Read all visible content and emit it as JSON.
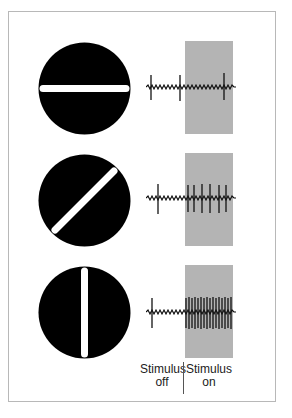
{
  "figure": {
    "title": "",
    "rows": [
      {
        "stimulus": "horizontal-bar",
        "orientation_deg": 0,
        "response": "weak"
      },
      {
        "stimulus": "diagonal-bar",
        "orientation_deg": 45,
        "response": "moderate"
      },
      {
        "stimulus": "vertical-bar",
        "orientation_deg": 90,
        "response": "strong"
      }
    ],
    "labels": {
      "off_line1": "Stimulus",
      "off_line2": "off",
      "on_line1": "Stimulus",
      "on_line2": "on"
    },
    "colors": {
      "stimulus_disk": "#000000",
      "bar": "#ffffff",
      "stimulus_on_region": "#b4b4b4",
      "frame": "#b8b8b8"
    }
  }
}
